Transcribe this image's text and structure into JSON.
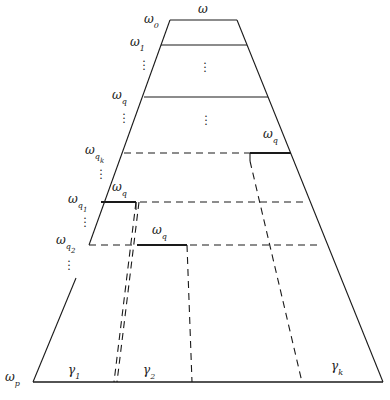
{
  "figure": {
    "type": "partition-trapezoid-diagram",
    "background": "#ffffff",
    "stroke_color": "#1a1a1a",
    "labels": {
      "omega_top": "ω",
      "omega_0": "ω",
      "omega_0_sub": "0",
      "omega_1": "ω",
      "omega_1_sub": "1",
      "omega_q_left": "ω",
      "omega_q_left_sub": "q",
      "omega_qk": "ω",
      "omega_qk_sub": "q",
      "omega_qk_subsub": "k",
      "omega_q_right": "ω",
      "omega_q_right_sub": "q",
      "omega_q_mid_upper": "ω",
      "omega_q_mid_upper_sub": "q",
      "omega_q1": "ω",
      "omega_q1_sub": "q",
      "omega_q1_subsub": "1",
      "omega_q2": "ω",
      "omega_q2_sub": "q",
      "omega_q2_subsub": "2",
      "omega_q_mid_lower": "ω",
      "omega_q_mid_lower_sub": "q",
      "omega_p": "ω",
      "omega_p_sub": "p",
      "gamma_1": "γ",
      "gamma_1_sub": "1",
      "gamma_2": "γ",
      "gamma_2_sub": "2",
      "gamma_k": "γ",
      "gamma_k_sub": "k"
    },
    "vertical_ellipses": [
      {
        "name": "left-ellipsis-between-omega1-omegaq"
      },
      {
        "name": "left-ellipsis-between-omegaq-omegaqk"
      },
      {
        "name": "left-ellipsis-between-omegaqk-omegaq1"
      },
      {
        "name": "left-ellipsis-between-omegaq1-omegaq2"
      },
      {
        "name": "left-ellipsis-below-omegaq2"
      },
      {
        "name": "center-ellipsis-upper"
      },
      {
        "name": "center-ellipsis-lower"
      }
    ]
  }
}
